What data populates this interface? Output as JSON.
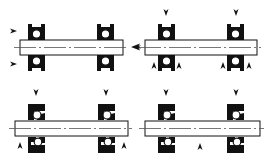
{
  "diagram": {
    "title": "",
    "colors": {
      "ink": "#111111",
      "shaft_fill": "#ffffff",
      "centerline": "#555555",
      "background": "#ffffff"
    },
    "panels": [
      {
        "id": "panel-1",
        "description": "Two bearings, axial load from right end; preload arrows on left bearing pointing right",
        "shaft": {
          "x": 20,
          "y": 40,
          "w": 103,
          "h": 15
        },
        "bearings": [
          {
            "x": 28,
            "type": "full"
          },
          {
            "x": 97,
            "type": "full"
          }
        ],
        "arrows": [
          {
            "x": 17,
            "y": 31,
            "dir": "right"
          },
          {
            "x": 17,
            "y": 64,
            "dir": "right"
          },
          {
            "x": 131,
            "y": 47,
            "dir": "left",
            "large": true
          }
        ]
      },
      {
        "id": "panel-2",
        "description": "Two bearings, radial loads from top, reaction arrows flanking bottom bearings",
        "shaft": {
          "x": 145,
          "y": 40,
          "w": 112,
          "h": 15
        },
        "bearings": [
          {
            "x": 158,
            "type": "full"
          },
          {
            "x": 227,
            "type": "full"
          }
        ],
        "arrows": [
          {
            "x": 166,
            "y": 16,
            "dir": "down"
          },
          {
            "x": 236,
            "y": 16,
            "dir": "down"
          },
          {
            "x": 154,
            "y": 62,
            "dir": "up"
          },
          {
            "x": 179,
            "y": 62,
            "dir": "up"
          },
          {
            "x": 223,
            "y": 62,
            "dir": "up"
          },
          {
            "x": 249,
            "y": 62,
            "dir": "up"
          },
          {
            "x": 136,
            "y": 47,
            "dir": "left",
            "small": true
          }
        ]
      },
      {
        "id": "panel-3",
        "description": "Two split bearings, radial loads from top, reaction arrows at outer ends below",
        "shaft": {
          "x": 15,
          "y": 121,
          "w": 113,
          "h": 15
        },
        "bearings": [
          {
            "x": 28,
            "type": "split"
          },
          {
            "x": 98,
            "type": "split"
          }
        ],
        "arrows": [
          {
            "x": 36,
            "y": 96,
            "dir": "down"
          },
          {
            "x": 106,
            "y": 96,
            "dir": "down"
          },
          {
            "x": 20,
            "y": 142,
            "dir": "up"
          },
          {
            "x": 124,
            "y": 142,
            "dir": "up"
          }
        ]
      },
      {
        "id": "panel-4",
        "description": "Two split bearings, radial loads from top, single reaction arrow at center below",
        "shaft": {
          "x": 145,
          "y": 121,
          "w": 115,
          "h": 15
        },
        "bearings": [
          {
            "x": 158,
            "type": "split"
          },
          {
            "x": 227,
            "type": "split"
          }
        ],
        "arrows": [
          {
            "x": 166,
            "y": 96,
            "dir": "down"
          },
          {
            "x": 236,
            "y": 96,
            "dir": "down"
          },
          {
            "x": 200,
            "y": 143,
            "dir": "up"
          }
        ]
      }
    ]
  }
}
